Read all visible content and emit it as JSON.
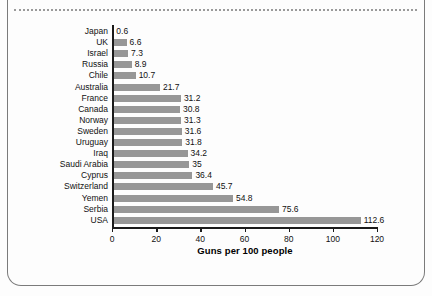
{
  "document": {
    "border_color": "#7b7b7b",
    "background_color": "#fdfdfd",
    "dotted_rule_color": "#9a9a9a"
  },
  "chart_data": {
    "type": "bar",
    "orientation": "horizontal",
    "title": "",
    "xlabel": "Guns per 100 people",
    "ylabel": "",
    "xlim": [
      0,
      120
    ],
    "xticks": [
      0,
      20,
      40,
      60,
      80,
      100,
      120
    ],
    "grid": false,
    "legend": false,
    "bar_color": "#979797",
    "categories": [
      "Japan",
      "UK",
      "Israel",
      "Russia",
      "Chile",
      "Australia",
      "France",
      "Canada",
      "Norway",
      "Sweden",
      "Uruguay",
      "Iraq",
      "Saudi Arabia",
      "Cyprus",
      "Switzerland",
      "Yemen",
      "Serbia",
      "USA"
    ],
    "values": [
      0.6,
      6.6,
      7.3,
      8.9,
      10.7,
      21.7,
      31.2,
      30.8,
      31.3,
      31.6,
      31.8,
      34.2,
      35,
      36.4,
      45.7,
      54.8,
      75.6,
      112.6
    ],
    "value_labels": [
      "0.6",
      "6.6",
      "7.3",
      "8.9",
      "10.7",
      "21.7",
      "31.2",
      "30.8",
      "31.3",
      "31.6",
      "31.8",
      "34.2",
      "35",
      "36.4",
      "45.7",
      "54.8",
      "75.6",
      "112.6"
    ]
  }
}
